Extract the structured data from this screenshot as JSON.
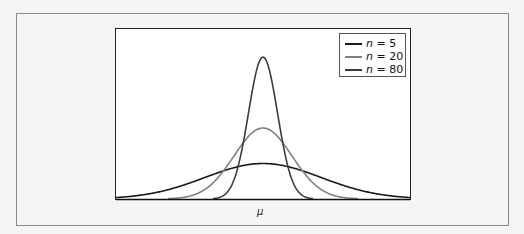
{
  "chart_data": {
    "type": "line",
    "title": "",
    "xlabel": "μ",
    "ylabel": "",
    "grid": false,
    "legend_position": "upper right",
    "x_range": [
      -1,
      1
    ],
    "series": [
      {
        "name": "n = 5",
        "n": 5,
        "color": "#1a1a1a",
        "relative_peak_height": 1,
        "relative_std": 1
      },
      {
        "name": "n = 20",
        "n": 20,
        "color": "#808080",
        "relative_peak_height": 2,
        "relative_std": 0.5
      },
      {
        "name": "n = 80",
        "n": 80,
        "color": "#3c3c3c",
        "relative_peak_height": 4,
        "relative_std": 0.25
      }
    ],
    "note": "Gaussian posterior curves centered at mu; std shrinks as 1/sqrt(n)"
  },
  "legend": {
    "items": [
      {
        "var": "n",
        "eq": " = 5",
        "color": "#1a1a1a"
      },
      {
        "var": "n",
        "eq": " = 20",
        "color": "#808080"
      },
      {
        "var": "n",
        "eq": " = 80",
        "color": "#3c3c3c"
      }
    ]
  },
  "axes": {
    "xlabel": "μ"
  }
}
